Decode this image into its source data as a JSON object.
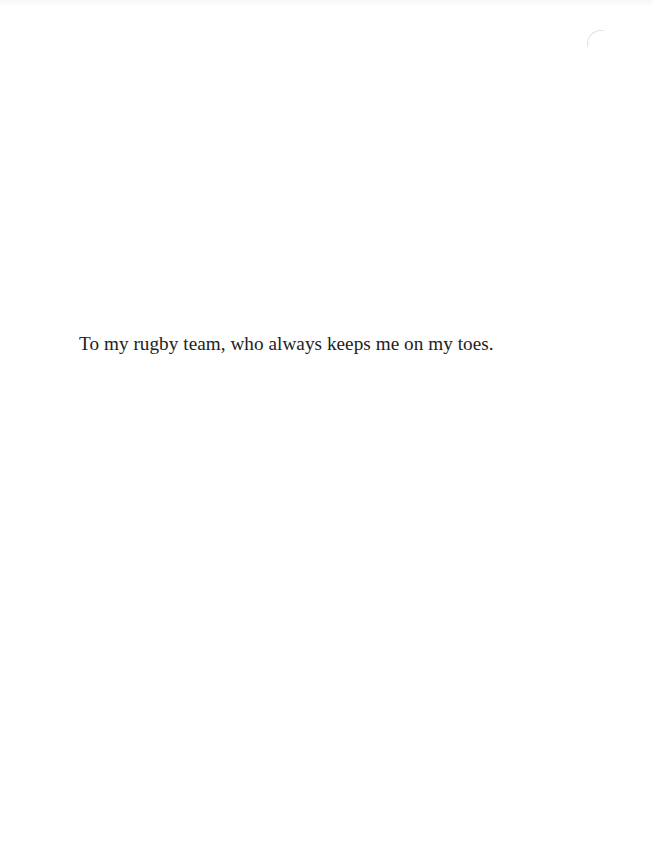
{
  "page": {
    "type": "dedication",
    "background": "#ffffff",
    "text_color": "#222222"
  },
  "dedication": {
    "text": "To my rugby team, who always keeps me on my toes."
  }
}
